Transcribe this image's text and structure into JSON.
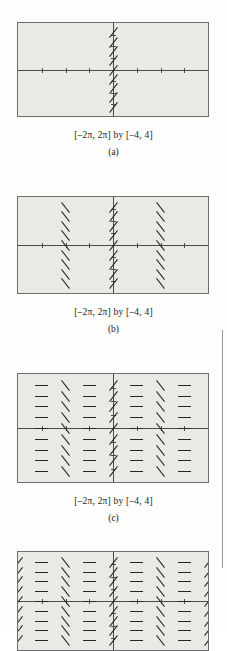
{
  "figure": {
    "type": "slope-field-series",
    "panels": [
      {
        "id": "a",
        "label": "(a)",
        "range_caption": "[–2π, 2π] by [–4, 4]",
        "x_range": [
          -6.2831853,
          6.2831853
        ],
        "y_range": [
          -4,
          4
        ],
        "x_axis_label": "",
        "y_axis_label": "",
        "columns_drawn": 1,
        "column_x_values": [
          0
        ],
        "column_kinds": [
          "up"
        ],
        "rows_per_column": 9,
        "description": "slope field for dy/dx = cos x drawn only along the y-axis; segments slope upward"
      },
      {
        "id": "b",
        "label": "(b)",
        "range_caption": "[–2π, 2π] by [–4, 4]",
        "x_range": [
          -6.2831853,
          6.2831853
        ],
        "y_range": [
          -4,
          4
        ],
        "columns_drawn": 3,
        "column_x_values": [
          -3.1415927,
          0,
          3.1415927
        ],
        "column_kinds": [
          "down",
          "up",
          "down"
        ],
        "rows_per_column": 9,
        "description": "segments added at x = –π and x = π sloping downward"
      },
      {
        "id": "c",
        "label": "(c)",
        "range_caption": "[–2π, 2π] by [–4, 4]",
        "x_range": [
          -6.2831853,
          6.2831853
        ],
        "y_range": [
          -4,
          4
        ],
        "columns_drawn": 7,
        "column_x_values": [
          -4.712389,
          -3.1415927,
          -1.5707963,
          0,
          1.5707963,
          3.1415927,
          4.712389
        ],
        "column_kinds": [
          "flat",
          "down",
          "flat",
          "up",
          "flat",
          "down",
          "flat"
        ],
        "rows_per_column": 9,
        "description": "horizontal segments added at odd multiples of π/2 where cos x = 0"
      },
      {
        "id": "d",
        "label": "",
        "range_caption": "",
        "x_range": [
          -6.2831853,
          6.2831853
        ],
        "y_range": [
          -4,
          4
        ],
        "columns_drawn": 9,
        "column_x_values": [
          -6.2831853,
          -4.712389,
          -3.1415927,
          -1.5707963,
          0,
          1.5707963,
          3.1415927,
          4.712389,
          6.2831853
        ],
        "column_kinds": [
          "up",
          "flat",
          "down",
          "flat",
          "up",
          "flat",
          "down",
          "flat",
          "up"
        ],
        "rows_per_column": 9,
        "description": "fourth panel, partially visible at bottom of page; segments now fill the full window"
      }
    ],
    "colors": {
      "plot_background": "#e9e9e6",
      "plot_border": "#6d6d6b",
      "axis": "#4a4a48",
      "segment": "#252523",
      "page_background": "#fdfdfc",
      "page_rule": "#9a9a98"
    }
  }
}
